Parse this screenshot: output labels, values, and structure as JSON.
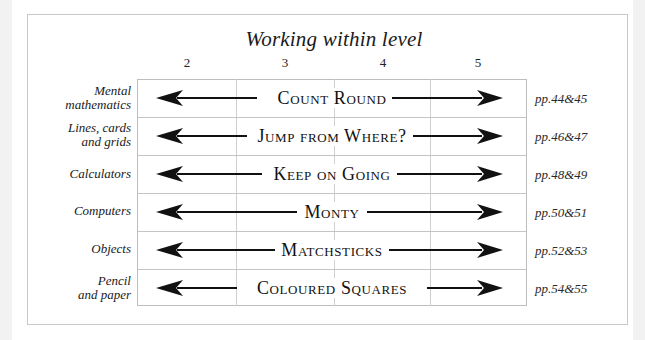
{
  "title": "Working within level",
  "levels": [
    "2",
    "3",
    "4",
    "5"
  ],
  "colors": {
    "frame_border": "#c8c8c8",
    "grid_line": "#c4c4c4",
    "arrow": "#111111",
    "text": "#1a1a1a",
    "background": "#ffffff"
  },
  "rows": [
    {
      "category": "Mental mathematics",
      "category_lines": [
        "Mental",
        "mathematics"
      ],
      "activity": "Count Round",
      "pages": "pp.44&45",
      "arrow_left_end": 236,
      "arrow_right_start": 356
    },
    {
      "category": "Lines, cards and grids",
      "category_lines": [
        "Lines, cards",
        "and grids"
      ],
      "activity": "Jump from Where?",
      "pages": "pp.46&47",
      "arrow_left_end": 253,
      "arrow_right_start": 381
    },
    {
      "category": "Calculators",
      "category_lines": [
        "Calculators"
      ],
      "activity": "Keep on Going",
      "pages": "pp.48&49",
      "arrow_left_end": 240,
      "arrow_right_start": 368
    },
    {
      "category": "Computers",
      "category_lines": [
        "Computers"
      ],
      "activity": "Monty",
      "pages": "pp.50&51",
      "arrow_left_end": 286,
      "arrow_right_start": 387
    },
    {
      "category": "Objects",
      "category_lines": [
        "Objects"
      ],
      "activity": "Matchsticks",
      "pages": "pp.52&53",
      "arrow_left_end": 264,
      "arrow_right_start": 392
    },
    {
      "category": "Pencil and paper",
      "category_lines": [
        "Pencil",
        "and paper"
      ],
      "activity": "Coloured Squares",
      "pages": "pp.54&55",
      "arrow_left_end": 224,
      "arrow_right_start": 416
    }
  ]
}
